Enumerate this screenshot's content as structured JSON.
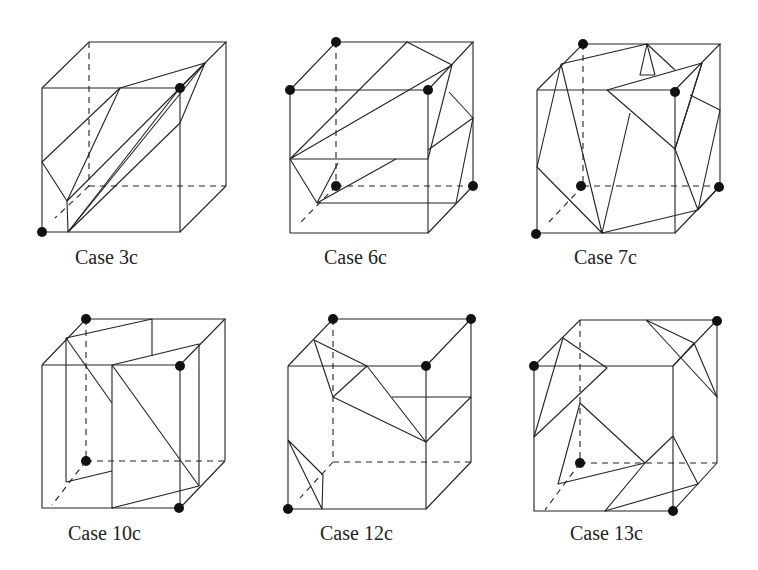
{
  "figure": {
    "type": "marching-cubes-case-diagram",
    "colors": {
      "line": "#222222",
      "vertex": "#111111",
      "background": "#ffffff"
    },
    "cases": [
      {
        "id": "case-3c",
        "label": "Case 3c",
        "origin": [
          42,
          42
        ],
        "label_pos": [
          75,
          246
        ]
      },
      {
        "id": "case-6c",
        "label": "Case 6c",
        "origin": [
          290,
          42
        ],
        "label_pos": [
          324,
          246
        ]
      },
      {
        "id": "case-7c",
        "label": "Case 7c",
        "origin": [
          536,
          42
        ],
        "label_pos": [
          574,
          246
        ]
      },
      {
        "id": "case-10c",
        "label": "Case 10c",
        "origin": [
          42,
          318
        ],
        "label_pos": [
          68,
          522
        ]
      },
      {
        "id": "case-12c",
        "label": "Case 12c",
        "origin": [
          288,
          318
        ],
        "label_pos": [
          320,
          522
        ]
      },
      {
        "id": "case-13c",
        "label": "Case 13c",
        "origin": [
          534,
          318
        ],
        "label_pos": [
          570,
          522
        ]
      }
    ]
  }
}
